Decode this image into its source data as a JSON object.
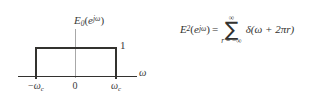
{
  "figure": {
    "background_color": "#ffffff",
    "ink_color": "#33322f",
    "axis_gray": "#a8a8a8"
  },
  "plot": {
    "title": {
      "base": "E",
      "subscript": "0",
      "open_paren": "(",
      "exp_base": "e",
      "exp_superscript": "jω",
      "close_paren": ")"
    },
    "amplitude_label": "1",
    "axis_label": "ω",
    "tick_labels": [
      {
        "name": "negative-cutoff",
        "minus": "−",
        "symbol": "ω",
        "subscript": "c"
      },
      {
        "name": "origin",
        "text": "0"
      },
      {
        "name": "positive-cutoff",
        "minus": "",
        "symbol": "ω",
        "subscript": "c"
      }
    ]
  },
  "equation": {
    "lhs": {
      "base": "E",
      "subscript": "2",
      "open_paren": "(",
      "exp_base": "e",
      "exp_superscript": "jω",
      "close_paren": ")"
    },
    "equals": "=",
    "summation": {
      "symbol": "∑",
      "upper_limit": "∞",
      "lower_limit_variable": "r",
      "lower_limit_equals": " = ",
      "lower_limit_value": "−∞"
    },
    "summand": "δ(ω + 2πr)"
  }
}
